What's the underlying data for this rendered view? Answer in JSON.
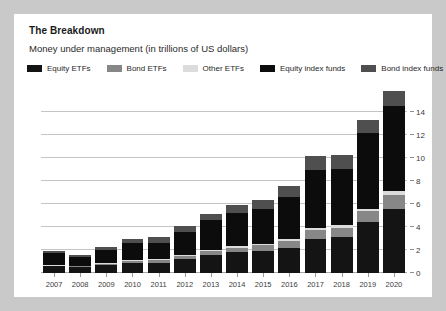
{
  "card": {
    "title": "The Breakdown",
    "subtitle": "Money under management (in trillions of US dollars)"
  },
  "legend": {
    "items": [
      {
        "label": "Equity ETFs",
        "color": "#141414",
        "swatch_name": "legend-swatch-equity-etfs"
      },
      {
        "label": "Bond ETFs",
        "color": "#878787",
        "swatch_name": "legend-swatch-bond-etfs"
      },
      {
        "label": "Other ETFs",
        "color": "#dcdcdc",
        "swatch_name": "legend-swatch-other-etfs"
      },
      {
        "label": "Equity index funds",
        "color": "#0c0c0c",
        "swatch_name": "legend-swatch-equity-index-funds"
      },
      {
        "label": "Bond index funds",
        "color": "#4f4f4f",
        "swatch_name": "legend-swatch-bond-index-funds"
      }
    ]
  },
  "axes": {
    "yticks": [
      0,
      2,
      4,
      6,
      8,
      10,
      12,
      14
    ],
    "ylim": [
      0,
      16
    ],
    "xlabel": "",
    "ylabel": ""
  },
  "chart_data": {
    "type": "bar",
    "title": "The Breakdown",
    "subtitle": "Money under management (in trillions of US dollars)",
    "stacked": true,
    "xlabel": "",
    "ylabel": "Trillions of US dollars",
    "ylim": [
      0,
      16
    ],
    "yticks": [
      0,
      2,
      4,
      6,
      8,
      10,
      12,
      14
    ],
    "grid": true,
    "legend_position": "top",
    "categories": [
      "2007",
      "2008",
      "2009",
      "2010",
      "2011",
      "2012",
      "2013",
      "2014",
      "2015",
      "2016",
      "2017",
      "2018",
      "2019",
      "2020"
    ],
    "series": [
      {
        "name": "Equity ETFs",
        "color": "#141414",
        "values": [
          0.6,
          0.5,
          0.7,
          0.9,
          0.9,
          1.2,
          1.6,
          1.8,
          1.9,
          2.2,
          3.0,
          3.1,
          4.4,
          5.6
        ]
      },
      {
        "name": "Bond ETFs",
        "color": "#878787",
        "values": [
          0.05,
          0.08,
          0.12,
          0.15,
          0.2,
          0.25,
          0.3,
          0.4,
          0.5,
          0.6,
          0.75,
          0.85,
          0.95,
          1.2
        ]
      },
      {
        "name": "Other ETFs",
        "color": "#dcdcdc",
        "values": [
          0.05,
          0.05,
          0.08,
          0.1,
          0.1,
          0.12,
          0.12,
          0.15,
          0.15,
          0.18,
          0.2,
          0.2,
          0.25,
          0.3
        ]
      },
      {
        "name": "Equity index funds",
        "color": "#0c0c0c",
        "values": [
          1.0,
          0.75,
          1.1,
          1.45,
          1.45,
          2.0,
          2.6,
          2.9,
          3.0,
          3.6,
          5.0,
          4.9,
          6.6,
          7.4
        ]
      },
      {
        "name": "Bond index funds",
        "color": "#4f4f4f",
        "values": [
          0.2,
          0.2,
          0.3,
          0.4,
          0.45,
          0.55,
          0.55,
          0.7,
          0.8,
          1.0,
          1.2,
          1.2,
          1.1,
          1.3
        ]
      }
    ]
  }
}
